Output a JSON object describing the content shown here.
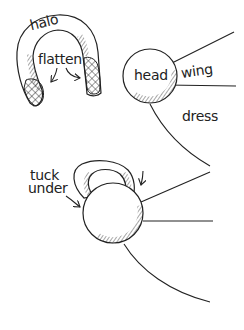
{
  "diagram": {
    "type": "craft-instruction-sketch",
    "colors": {
      "stroke": "#222222",
      "background": "#ffffff"
    },
    "step1": {
      "halo": {
        "label": "halo",
        "instruction": "flatten"
      },
      "figure": {
        "head_label": "head",
        "wing_label": "wing",
        "dress_label": "dress"
      }
    },
    "step2": {
      "instruction_line1": "tuck",
      "instruction_line2": "under"
    }
  }
}
